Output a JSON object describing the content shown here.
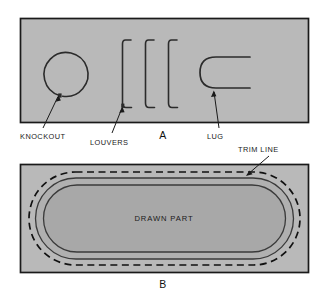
{
  "figure": {
    "background_color": "#ffffff",
    "panel_fill": "#b9b9b9",
    "panel_stroke": "#1a1a1a",
    "line_color": "#2b2b2b",
    "text_color": "#1a1a1a",
    "drawn_part_fill": "#a8a8a8",
    "flange_fill": "#b0b0b0"
  },
  "panel_a": {
    "letter": "A",
    "features": [
      {
        "name": "knockout",
        "label": "KNOCKOUT",
        "shape": "circle-with-tab"
      },
      {
        "name": "louvers",
        "label": "LOUVERS",
        "shape": "three-vertical-brackets",
        "count": 3
      },
      {
        "name": "lug",
        "label": "LUG",
        "shape": "u-bend-open-right"
      }
    ]
  },
  "panel_b": {
    "letter": "B",
    "center_label": "DRAWN PART",
    "callout": {
      "name": "trim-line",
      "label": "TRIM LINE",
      "style": "dashed"
    },
    "regions": [
      {
        "name": "blank-flange",
        "style": "solid-outline"
      },
      {
        "name": "trim-line-boundary",
        "style": "dashed-outline"
      },
      {
        "name": "drawn-part-body",
        "style": "filled-stadium"
      }
    ]
  },
  "labels": {
    "knockout": "KNOCKOUT",
    "louvers": "LOUVERS",
    "lug": "LUG",
    "trim_line": "TRIM LINE",
    "drawn_part": "DRAWN PART",
    "letter_a": "A",
    "letter_b": "B"
  }
}
